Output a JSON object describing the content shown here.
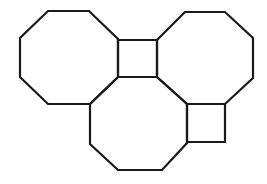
{
  "canvas": {
    "width": 267,
    "height": 184,
    "background": "#ffffff"
  },
  "stroke_color": "#1a1a1a",
  "shapes": [
    {
      "type": "octagon",
      "name": "left-octagon",
      "points": "48,11 89,11 118,39 118,77 90,104 48,104 20,77 20,38"
    },
    {
      "type": "octagon",
      "name": "right-octagon",
      "points": "185,12 225,12 253,38 253,78 225,104 187,104 157,77 157,40"
    },
    {
      "type": "octagon",
      "name": "bottom-octagon",
      "points": "118,77 157,77 187,104 187,143 162,170 118,170 90,144 90,104"
    },
    {
      "type": "square",
      "name": "top-square",
      "points": "118,40 157,40 157,77 118,77"
    },
    {
      "type": "square",
      "name": "bottom-right-square",
      "points": "187,104 225,104 225,142 187,142"
    }
  ]
}
